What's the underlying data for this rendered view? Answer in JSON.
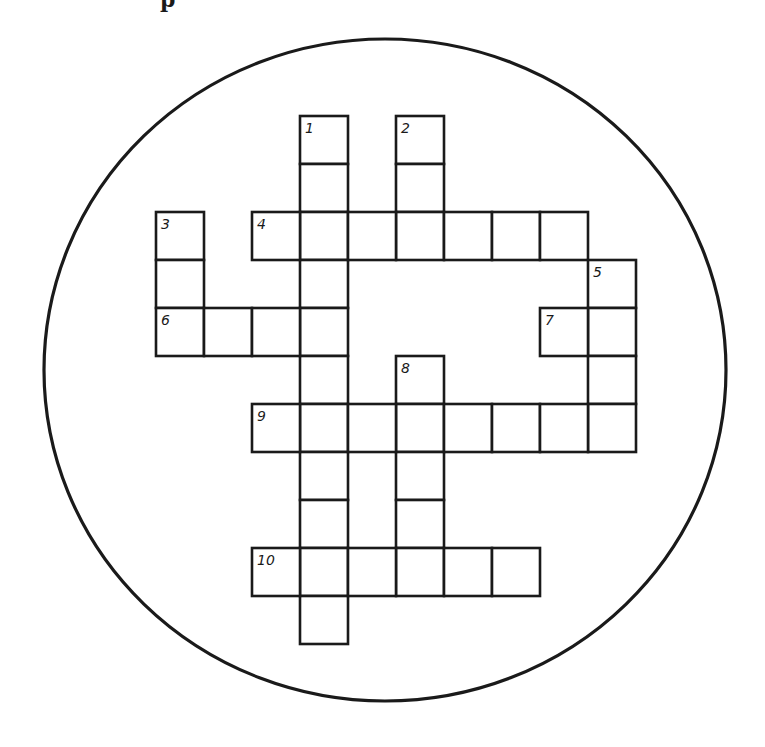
{
  "header": {
    "fragment_text": "p"
  },
  "puzzle": {
    "type": "crossword",
    "frame": {
      "shape": "ellipse",
      "cx": 385,
      "cy": 370,
      "rx": 341,
      "ry": 331,
      "stroke": "#1a1a1a"
    },
    "cell_size": 48,
    "line_color": "#1a1a1a",
    "background": "#ffffff",
    "grid_origin": {
      "x": 156,
      "y": 116
    },
    "entries": [
      {
        "number": 1,
        "direction": "down",
        "col": 3,
        "row": 0,
        "length": 11
      },
      {
        "number": 2,
        "direction": "down",
        "col": 5,
        "row": 0,
        "length": 3
      },
      {
        "number": 3,
        "direction": "down",
        "col": 0,
        "row": 2,
        "length": 3
      },
      {
        "number": 4,
        "direction": "across",
        "col": 2,
        "row": 2,
        "length": 7
      },
      {
        "number": 5,
        "direction": "down",
        "col": 9,
        "row": 3,
        "length": 4
      },
      {
        "number": 6,
        "direction": "across",
        "col": 0,
        "row": 4,
        "length": 4
      },
      {
        "number": 7,
        "direction": "across",
        "col": 8,
        "row": 4,
        "length": 2
      },
      {
        "number": 8,
        "direction": "down",
        "col": 5,
        "row": 5,
        "length": 5
      },
      {
        "number": 9,
        "direction": "across",
        "col": 2,
        "row": 6,
        "length": 8
      },
      {
        "number": 10,
        "direction": "across",
        "col": 2,
        "row": 9,
        "length": 6
      }
    ],
    "clue_numbers": [
      "1",
      "2",
      "3",
      "4",
      "5",
      "6",
      "7",
      "8",
      "9",
      "10"
    ]
  }
}
